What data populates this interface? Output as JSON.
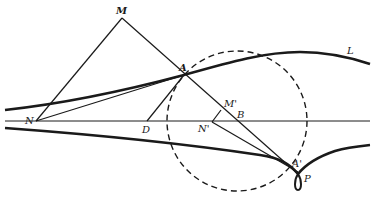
{
  "diagram": {
    "type": "geometric-construction",
    "colors": {
      "ink": "#1a1a1a",
      "background": "#ffffff"
    },
    "points": [
      {
        "id": "M",
        "label": "M",
        "x": 122,
        "y": 18,
        "lx": 116,
        "ly": 14
      },
      {
        "id": "A",
        "label": "A",
        "x": 184,
        "y": 75,
        "lx": 179,
        "ly": 71
      },
      {
        "id": "N",
        "label": "N",
        "x": 36,
        "y": 121,
        "lx": 25,
        "ly": 124
      },
      {
        "id": "D",
        "label": "D",
        "x": 147,
        "y": 121,
        "lx": 142,
        "ly": 133
      },
      {
        "id": "M'",
        "label": "M'",
        "x": 221,
        "y": 110,
        "lx": 224,
        "ly": 107
      },
      {
        "id": "B",
        "label": "B",
        "x": 237,
        "y": 121,
        "lx": 237,
        "ly": 118
      },
      {
        "id": "N'",
        "label": "N'",
        "x": 212,
        "y": 122,
        "lx": 198,
        "ly": 132
      },
      {
        "id": "A'",
        "label": "A'",
        "x": 291,
        "y": 163,
        "lx": 292,
        "ly": 167
      },
      {
        "id": "P",
        "label": "P",
        "x": 298,
        "y": 178,
        "lx": 304,
        "ly": 182
      },
      {
        "id": "L",
        "label": "L",
        "x": 348,
        "y": 52,
        "lx": 347,
        "ly": 54
      }
    ],
    "curves": [
      {
        "id": "curve-L",
        "name": "upper-curve-L"
      },
      {
        "id": "curve-lower",
        "name": "lower-curve-with-cusp-P"
      }
    ],
    "circle": {
      "cx": 237,
      "cy": 121,
      "r": 70,
      "style": "dashed"
    },
    "axis": {
      "x1": 5,
      "y1": 121,
      "x2": 370,
      "y2": 121
    }
  }
}
